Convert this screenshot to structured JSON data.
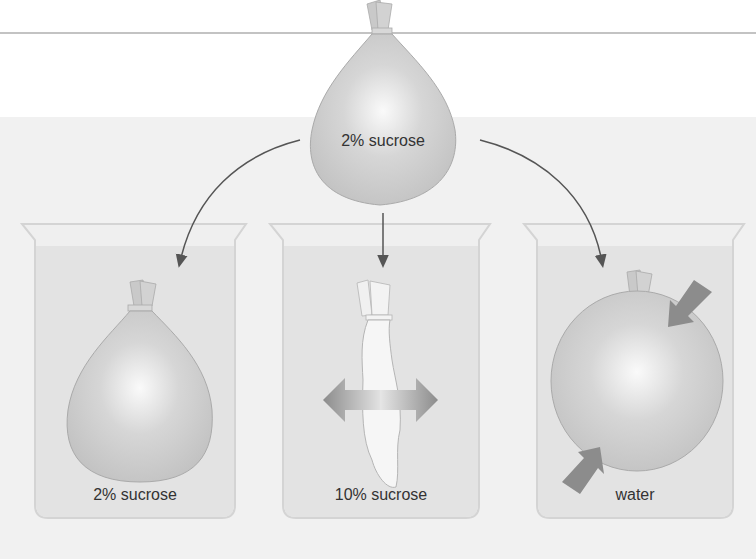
{
  "diagram": {
    "top_bag": {
      "label": "2% sucrose"
    },
    "beakers": [
      {
        "id": "isotonic",
        "solution_label": "2% sucrose",
        "bag_state": "unchanged"
      },
      {
        "id": "hypertonic",
        "solution_label": "10% sucrose",
        "bag_state": "shriveled"
      },
      {
        "id": "hypotonic",
        "solution_label": "water",
        "bag_state": "swollen"
      }
    ],
    "colors": {
      "background_band": "#f1f1f1",
      "beaker_outline": "#d4d4d4",
      "solution_fill": "#e3e3e3",
      "bag_fill": "#c6c6c6",
      "bag_highlight": "#fafafa",
      "arrow": "#555555",
      "flow_arrow": "#8a8a8a",
      "rule_line": "#888888"
    }
  }
}
